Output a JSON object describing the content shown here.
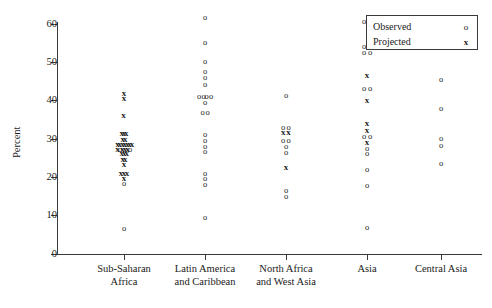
{
  "chart_data": {
    "type": "scatter",
    "title": "",
    "xlabel": "",
    "ylabel": "Percent",
    "ylim": [
      0,
      62
    ],
    "yticks": [
      0,
      10,
      20,
      30,
      40,
      50,
      60
    ],
    "ytick_labels": [
      "0",
      "10",
      "20",
      "30",
      "40",
      "50",
      "60"
    ],
    "grid": false,
    "legend": {
      "position": "top-right",
      "entries": [
        {
          "label": "Observed",
          "symbol": "o",
          "marker": "circle"
        },
        {
          "label": "Projected",
          "symbol": "x",
          "marker": "cross"
        }
      ]
    },
    "categories": [
      "Sub-Saharan\nAfrica",
      "Latin America\nand Caribbean",
      "North Africa\nand West Asia",
      "Asia",
      "Central Asia"
    ],
    "series": [
      {
        "name": "Sub-Saharan Africa",
        "category_index": 0,
        "points": [
          {
            "value": 41.8,
            "type": "Projected",
            "offset": 0.0
          },
          {
            "value": 40.5,
            "type": "Projected",
            "offset": 0.0
          },
          {
            "value": 36.0,
            "type": "Projected",
            "offset": -0.6
          },
          {
            "value": 31.2,
            "type": "Projected",
            "offset": -2.3
          },
          {
            "value": 31.2,
            "type": "Projected",
            "offset": 0.0
          },
          {
            "value": 31.2,
            "type": "Projected",
            "offset": 2.3
          },
          {
            "value": 29.8,
            "type": "Projected",
            "offset": -1.2
          },
          {
            "value": 29.8,
            "type": "Projected",
            "offset": 1.2
          },
          {
            "value": 28.5,
            "type": "Projected",
            "offset": -6.5
          },
          {
            "value": 28.5,
            "type": "Projected",
            "offset": -4.2
          },
          {
            "value": 28.5,
            "type": "Projected",
            "offset": -1.6
          },
          {
            "value": 28.5,
            "type": "Projected",
            "offset": 0.8
          },
          {
            "value": 28.5,
            "type": "Projected",
            "offset": 3.2
          },
          {
            "value": 28.5,
            "type": "Projected",
            "offset": 5.6
          },
          {
            "value": 28.5,
            "type": "Projected",
            "offset": 8.0
          },
          {
            "value": 27.2,
            "type": "Projected",
            "offset": -6.5
          },
          {
            "value": 27.2,
            "type": "Observed",
            "offset": -4.0
          },
          {
            "value": 27.2,
            "type": "Projected",
            "offset": -1.5
          },
          {
            "value": 27.2,
            "type": "Projected",
            "offset": 1.0
          },
          {
            "value": 27.2,
            "type": "Projected",
            "offset": 3.5
          },
          {
            "value": 27.2,
            "type": "Observed",
            "offset": 6.2
          },
          {
            "value": 26.0,
            "type": "Projected",
            "offset": -2.2
          },
          {
            "value": 26.0,
            "type": "Projected",
            "offset": 0.3
          },
          {
            "value": 26.0,
            "type": "Projected",
            "offset": 2.8
          },
          {
            "value": 24.6,
            "type": "Projected",
            "offset": -1.2
          },
          {
            "value": 24.6,
            "type": "Projected",
            "offset": 1.3
          },
          {
            "value": 23.2,
            "type": "Projected",
            "offset": 0.0
          },
          {
            "value": 21.0,
            "type": "Projected",
            "offset": -3.0
          },
          {
            "value": 21.0,
            "type": "Projected",
            "offset": 0.0
          },
          {
            "value": 21.0,
            "type": "Projected",
            "offset": 3.0
          },
          {
            "value": 19.5,
            "type": "Projected",
            "offset": 0.0
          },
          {
            "value": 18.2,
            "type": "Observed",
            "offset": 0.0
          },
          {
            "value": 6.5,
            "type": "Observed",
            "offset": 0.0
          }
        ]
      },
      {
        "name": "Latin America and Caribbean",
        "category_index": 1,
        "points": [
          {
            "value": 61.5,
            "type": "Observed",
            "offset": 0.0
          },
          {
            "value": 55.0,
            "type": "Observed",
            "offset": 0.0
          },
          {
            "value": 50.2,
            "type": "Observed",
            "offset": 0.0
          },
          {
            "value": 47.5,
            "type": "Observed",
            "offset": 0.0
          },
          {
            "value": 45.8,
            "type": "Observed",
            "offset": 0.0
          },
          {
            "value": 44.2,
            "type": "Observed",
            "offset": 0.0
          },
          {
            "value": 41.0,
            "type": "Observed",
            "offset": -6.0
          },
          {
            "value": 41.0,
            "type": "Observed",
            "offset": -1.5
          },
          {
            "value": 41.0,
            "type": "Observed",
            "offset": 1.5
          },
          {
            "value": 41.0,
            "type": "Observed",
            "offset": 6.0
          },
          {
            "value": 39.5,
            "type": "Observed",
            "offset": 0.0
          },
          {
            "value": 36.8,
            "type": "Observed",
            "offset": -2.5
          },
          {
            "value": 36.8,
            "type": "Observed",
            "offset": 2.5
          },
          {
            "value": 31.0,
            "type": "Observed",
            "offset": 0.0
          },
          {
            "value": 29.4,
            "type": "Observed",
            "offset": 0.0
          },
          {
            "value": 27.9,
            "type": "Observed",
            "offset": 0.0
          },
          {
            "value": 26.5,
            "type": "Observed",
            "offset": 0.0
          },
          {
            "value": 21.0,
            "type": "Observed",
            "offset": 0.0
          },
          {
            "value": 19.5,
            "type": "Observed",
            "offset": 0.0
          },
          {
            "value": 18.0,
            "type": "Observed",
            "offset": 0.0
          },
          {
            "value": 9.5,
            "type": "Observed",
            "offset": 0.0
          }
        ]
      },
      {
        "name": "North Africa and West Asia",
        "category_index": 2,
        "points": [
          {
            "value": 41.2,
            "type": "Observed",
            "offset": 0.0
          },
          {
            "value": 33.0,
            "type": "Observed",
            "offset": -2.8
          },
          {
            "value": 33.0,
            "type": "Observed",
            "offset": 2.6
          },
          {
            "value": 31.6,
            "type": "Projected",
            "offset": -2.8
          },
          {
            "value": 31.6,
            "type": "Projected",
            "offset": 2.6
          },
          {
            "value": 29.4,
            "type": "Observed",
            "offset": -2.8
          },
          {
            "value": 29.4,
            "type": "Observed",
            "offset": 2.6
          },
          {
            "value": 28.0,
            "type": "Observed",
            "offset": 0.0
          },
          {
            "value": 26.4,
            "type": "Observed",
            "offset": 0.0
          },
          {
            "value": 22.5,
            "type": "Projected",
            "offset": 0.0
          },
          {
            "value": 16.5,
            "type": "Observed",
            "offset": 0.0
          },
          {
            "value": 15.0,
            "type": "Observed",
            "offset": 0.0
          }
        ]
      },
      {
        "name": "Asia",
        "category_index": 3,
        "points": [
          {
            "value": 60.5,
            "type": "Observed",
            "offset": -3.0
          },
          {
            "value": 60.5,
            "type": "Observed",
            "offset": 3.0
          },
          {
            "value": 54.0,
            "type": "Observed",
            "offset": -3.0
          },
          {
            "value": 54.0,
            "type": "Observed",
            "offset": 3.0
          },
          {
            "value": 52.5,
            "type": "Observed",
            "offset": -3.0
          },
          {
            "value": 52.5,
            "type": "Observed",
            "offset": 3.0
          },
          {
            "value": 46.5,
            "type": "Projected",
            "offset": 0.0
          },
          {
            "value": 43.0,
            "type": "Observed",
            "offset": -3.0
          },
          {
            "value": 43.0,
            "type": "Observed",
            "offset": 3.0
          },
          {
            "value": 40.0,
            "type": "Projected",
            "offset": 0.0
          },
          {
            "value": 33.8,
            "type": "Projected",
            "offset": 0.0
          },
          {
            "value": 32.2,
            "type": "Projected",
            "offset": 0.0
          },
          {
            "value": 30.5,
            "type": "Observed",
            "offset": -3.0
          },
          {
            "value": 30.5,
            "type": "Observed",
            "offset": 3.0
          },
          {
            "value": 29.0,
            "type": "Projected",
            "offset": 0.0
          },
          {
            "value": 27.5,
            "type": "Observed",
            "offset": 0.0
          },
          {
            "value": 26.0,
            "type": "Observed",
            "offset": 0.0
          },
          {
            "value": 22.0,
            "type": "Observed",
            "offset": 0.0
          },
          {
            "value": 17.8,
            "type": "Observed",
            "offset": 0.0
          },
          {
            "value": 6.8,
            "type": "Observed",
            "offset": 0.0
          }
        ]
      },
      {
        "name": "Central Asia",
        "category_index": 4,
        "points": [
          {
            "value": 45.5,
            "type": "Observed",
            "offset": 0.0
          },
          {
            "value": 37.8,
            "type": "Observed",
            "offset": 0.0
          },
          {
            "value": 30.0,
            "type": "Observed",
            "offset": 0.0
          },
          {
            "value": 28.2,
            "type": "Observed",
            "offset": 0.0
          },
          {
            "value": 23.5,
            "type": "Observed",
            "offset": 0.0
          }
        ]
      }
    ]
  }
}
